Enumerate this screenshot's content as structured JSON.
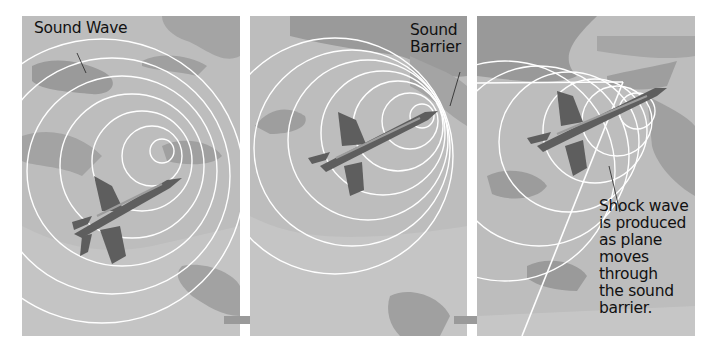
{
  "figure": {
    "panels": [
      {
        "id": "subsonic",
        "label": "Sound Wave"
      },
      {
        "id": "sound-barrier",
        "label_lines": [
          "Sound",
          "Barrier"
        ]
      },
      {
        "id": "supersonic",
        "label_lines": [
          "Shock wave",
          "is produced",
          "as plane",
          "moves",
          "through",
          "the sound",
          "barrier."
        ]
      }
    ],
    "colors": {
      "background": "#b9b9b9",
      "camo_dark": "#8f8f8f",
      "camo_light": "#cacaca",
      "plane": "#5e5e5e",
      "wave": "#ffffff",
      "arrow": "#9a9a9a"
    }
  }
}
